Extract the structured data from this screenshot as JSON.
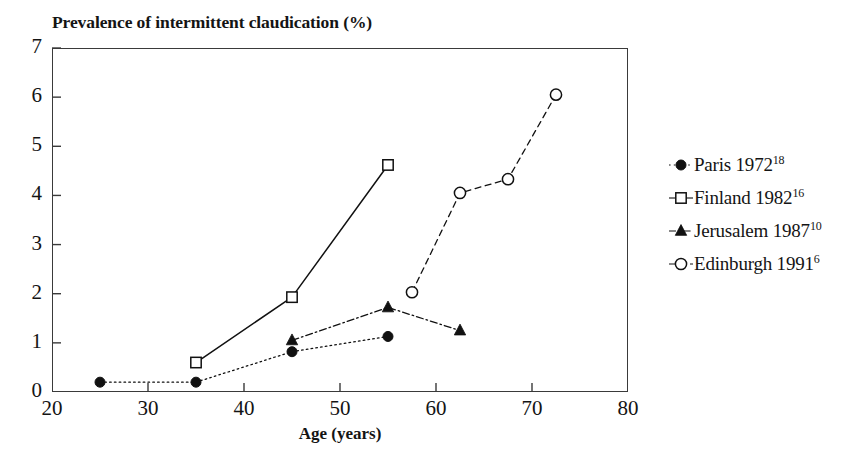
{
  "chart_data": {
    "type": "line",
    "title": "Prevalence of intermittent claudication (%)",
    "xlabel": "Age (years)",
    "ylabel": "",
    "xlim": [
      20,
      80
    ],
    "ylim": [
      0,
      7
    ],
    "xticks": [
      20,
      30,
      40,
      50,
      60,
      70,
      80
    ],
    "yticks": [
      0,
      1,
      2,
      3,
      4,
      5,
      6,
      7
    ],
    "grid": false,
    "legend_position": "right",
    "series": [
      {
        "name": "Paris 1972",
        "reference": "18",
        "marker": "filled-circle",
        "linestyle": "dotted",
        "color": "#111111",
        "x": [
          25,
          35,
          45,
          55
        ],
        "values": [
          0.2,
          0.2,
          0.82,
          1.13
        ]
      },
      {
        "name": "Finland 1982",
        "reference": "16",
        "marker": "open-square",
        "linestyle": "solid",
        "color": "#111111",
        "x": [
          35,
          45,
          55
        ],
        "values": [
          0.6,
          1.93,
          4.62
        ]
      },
      {
        "name": "Jerusalem 1987",
        "reference": "10",
        "marker": "filled-triangle",
        "linestyle": "dashdot",
        "color": "#111111",
        "x": [
          45,
          55,
          62.5
        ],
        "values": [
          1.05,
          1.72,
          1.25
        ]
      },
      {
        "name": "Edinburgh 1991",
        "reference": "6",
        "marker": "open-circle",
        "linestyle": "dashed",
        "color": "#111111",
        "x": [
          57.5,
          62.5,
          67.5,
          72.5
        ],
        "values": [
          2.03,
          4.05,
          4.33,
          6.05
        ]
      }
    ]
  },
  "legend": {
    "items": [
      {
        "label": "Paris 1972",
        "sup": "18"
      },
      {
        "label": "Finland 1982",
        "sup": "16"
      },
      {
        "label": "Jerusalem 1987",
        "sup": "10"
      },
      {
        "label": "Edinburgh 1991",
        "sup": "6"
      }
    ]
  }
}
